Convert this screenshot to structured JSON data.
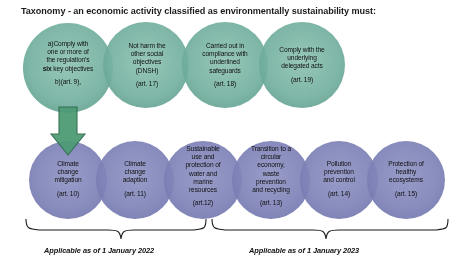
{
  "title": "Taxonomy - an economic activity classified as environmentally sustainability must:",
  "colors": {
    "green_circle": "#70ad9c",
    "green_circle_overlap": "#52957f",
    "purple_circle": "#7b7fb5",
    "purple_circle_overlap": "#4f5296",
    "arrow": "#4e9b76",
    "arrow_border": "#2f6b4c",
    "brace": "#1a1a1a",
    "text": "#111111"
  },
  "conditions_row": {
    "label": "taxonomy-conditions",
    "circles": [
      {
        "id": "condition-comply-objectives",
        "line_a": "a)Comply with",
        "line_b": "one or more of",
        "line_c": "the regulation’s",
        "line_d_bold": "six",
        "line_d_rest": " key objectives",
        "article": "b)(art. 9),"
      },
      {
        "id": "condition-dnsh",
        "lines": [
          "Not harm the",
          "other social",
          "objectives",
          "(DNSH)"
        ],
        "article": "(art. 17)"
      },
      {
        "id": "condition-safeguards",
        "lines": [
          "Carried out in",
          "compliance with",
          "underlined",
          "safeguards"
        ],
        "article": "(art. 18)"
      },
      {
        "id": "condition-delegated-acts",
        "lines": [
          "Comply with the",
          "underlying",
          "delegated acts"
        ],
        "article": "(art. 19)"
      }
    ]
  },
  "objectives_row": {
    "label": "six-key-objectives",
    "circles": [
      {
        "id": "objective-climate-mitigation",
        "lines": [
          "Climate",
          "change",
          "mitigation"
        ],
        "article": "(art. 10)"
      },
      {
        "id": "objective-climate-adaption",
        "lines": [
          "Climate",
          "change",
          "adaption"
        ],
        "article": "(art. 11)"
      },
      {
        "id": "objective-water-marine",
        "lines": [
          "Sustainable",
          "use and",
          "protection of",
          "water and",
          "marine",
          "resources"
        ],
        "article": "(art.12)"
      },
      {
        "id": "objective-circular-economy",
        "lines": [
          "Transition to a",
          "circular",
          "economy,",
          "waste",
          "prevention",
          "and recycling"
        ],
        "article": "(art. 13)"
      },
      {
        "id": "objective-pollution",
        "lines": [
          "Pollution",
          "prevention",
          "and control"
        ],
        "article": "(art. 14)"
      },
      {
        "id": "objective-ecosystems",
        "lines": [
          "Protection of",
          "healthy",
          "ecosystems"
        ],
        "article": "(art. 15)"
      }
    ]
  },
  "captions": {
    "left": "Applicable as of 1 January 2022",
    "right": "Applicable as of 1 January 2023"
  },
  "arrow": {
    "name": "down-arrow",
    "from": "condition-comply-objectives",
    "to": "objective-climate-mitigation"
  }
}
